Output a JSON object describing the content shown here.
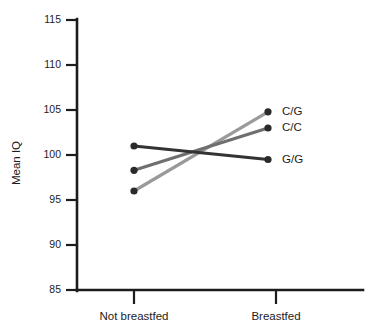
{
  "chart_data": {
    "type": "line",
    "title": "",
    "xlabel": "",
    "ylabel": "Mean IQ",
    "categories": [
      "Not breastfed",
      "Breastfed"
    ],
    "ylim": [
      85,
      115
    ],
    "yticks": [
      85,
      90,
      95,
      100,
      105,
      110,
      115
    ],
    "ytick_labels": [
      "85",
      "90",
      "95",
      "100",
      "105",
      "110",
      "115"
    ],
    "grid": false,
    "legend_position": "right-inline-labels",
    "series": [
      {
        "name": "C/G",
        "label": "C/G",
        "color": "#9a9a9a",
        "values": [
          96.0,
          104.8
        ]
      },
      {
        "name": "C/C",
        "label": "C/C",
        "color": "#6f6f6f",
        "values": [
          98.3,
          103.0
        ]
      },
      {
        "name": "G/G",
        "label": "G/G",
        "color": "#333333",
        "values": [
          101.0,
          99.5
        ]
      }
    ]
  },
  "axis": {
    "y_title": "Mean IQ",
    "x_tick_0": "Not breastfed",
    "x_tick_1": "Breastfed"
  },
  "colors": {
    "axis": "#1c1c1c",
    "background": "#ffffff",
    "series_cg": "#9a9a9a",
    "series_cc": "#6f6f6f",
    "series_gg": "#333333"
  }
}
